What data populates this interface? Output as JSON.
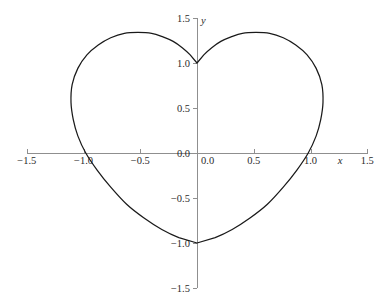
{
  "chart_data": {
    "type": "line",
    "title": "",
    "subtitle": "",
    "xlabel": "x",
    "ylabel": "y",
    "xlim": [
      -1.5,
      1.5
    ],
    "ylim": [
      -1.5,
      1.5
    ],
    "grid": false,
    "legend": null,
    "curve_name": "heart-curve",
    "curve_color": "#1a1a1a",
    "axis_color": "#8f8f8f",
    "label_color": "#2b2b2b",
    "x_ticks": [
      {
        "value": -1.5,
        "label": "−1.5"
      },
      {
        "value": -1.0,
        "label": "−1.0"
      },
      {
        "value": -0.5,
        "label": "−0.5"
      },
      {
        "value": 0.0,
        "label": "0.0"
      },
      {
        "value": 0.5,
        "label": "0.5"
      },
      {
        "value": 1.0,
        "label": "1.0"
      },
      {
        "value": 1.5,
        "label": "1.5"
      }
    ],
    "y_ticks": [
      {
        "value": 1.5,
        "label": "1.5"
      },
      {
        "value": 1.0,
        "label": "1.0"
      },
      {
        "value": 0.5,
        "label": "0.5"
      },
      {
        "value": 0.0,
        "label": "0.0"
      },
      {
        "value": -0.5,
        "label": "−0.5"
      },
      {
        "value": -1.0,
        "label": "−1.0"
      },
      {
        "value": -1.5,
        "label": "−1.5"
      }
    ],
    "annotations": [
      {
        "name": "top-cusp",
        "x": 0.0,
        "y": 1.0
      },
      {
        "name": "bottom-point",
        "x": 0.0,
        "y": -1.0
      },
      {
        "name": "left-extreme",
        "x": -1.1,
        "y": 0.55
      },
      {
        "name": "right-extreme",
        "x": 1.1,
        "y": 0.55
      },
      {
        "name": "left-lobe-top",
        "x": -0.52,
        "y": 1.34
      },
      {
        "name": "right-lobe-top",
        "x": 0.52,
        "y": 1.34
      },
      {
        "name": "left-x-crossing",
        "x": -0.98,
        "y": 0.0
      },
      {
        "name": "right-x-crossing",
        "x": 0.98,
        "y": 0.0
      }
    ],
    "points": [
      {
        "x": 0.0,
        "y": 1.0
      },
      {
        "x": 0.06,
        "y": 1.09
      },
      {
        "x": 0.13,
        "y": 1.17
      },
      {
        "x": 0.21,
        "y": 1.24
      },
      {
        "x": 0.3,
        "y": 1.29
      },
      {
        "x": 0.4,
        "y": 1.33
      },
      {
        "x": 0.52,
        "y": 1.34
      },
      {
        "x": 0.64,
        "y": 1.33
      },
      {
        "x": 0.76,
        "y": 1.28
      },
      {
        "x": 0.87,
        "y": 1.2
      },
      {
        "x": 0.97,
        "y": 1.09
      },
      {
        "x": 1.05,
        "y": 0.94
      },
      {
        "x": 1.1,
        "y": 0.76
      },
      {
        "x": 1.11,
        "y": 0.56
      },
      {
        "x": 1.09,
        "y": 0.37
      },
      {
        "x": 1.05,
        "y": 0.19
      },
      {
        "x": 0.98,
        "y": 0.0
      },
      {
        "x": 0.88,
        "y": -0.19
      },
      {
        "x": 0.76,
        "y": -0.38
      },
      {
        "x": 0.62,
        "y": -0.57
      },
      {
        "x": 0.47,
        "y": -0.72
      },
      {
        "x": 0.31,
        "y": -0.85
      },
      {
        "x": 0.16,
        "y": -0.94
      },
      {
        "x": 0.0,
        "y": -1.0
      },
      {
        "x": -0.16,
        "y": -0.94
      },
      {
        "x": -0.31,
        "y": -0.85
      },
      {
        "x": -0.47,
        "y": -0.72
      },
      {
        "x": -0.62,
        "y": -0.57
      },
      {
        "x": -0.76,
        "y": -0.38
      },
      {
        "x": -0.88,
        "y": -0.19
      },
      {
        "x": -0.98,
        "y": 0.0
      },
      {
        "x": -1.05,
        "y": 0.19
      },
      {
        "x": -1.09,
        "y": 0.37
      },
      {
        "x": -1.11,
        "y": 0.56
      },
      {
        "x": -1.1,
        "y": 0.76
      },
      {
        "x": -1.05,
        "y": 0.94
      },
      {
        "x": -0.97,
        "y": 1.09
      },
      {
        "x": -0.87,
        "y": 1.2
      },
      {
        "x": -0.76,
        "y": 1.28
      },
      {
        "x": -0.64,
        "y": 1.33
      },
      {
        "x": -0.52,
        "y": 1.34
      },
      {
        "x": -0.4,
        "y": 1.33
      },
      {
        "x": -0.3,
        "y": 1.29
      },
      {
        "x": -0.21,
        "y": 1.24
      },
      {
        "x": -0.13,
        "y": 1.17
      },
      {
        "x": -0.06,
        "y": 1.09
      },
      {
        "x": 0.0,
        "y": 1.0
      }
    ]
  },
  "geometry": {
    "origin_px": {
      "x": 197,
      "y": 153
    },
    "px_per_unit_x": 113.5,
    "px_per_unit_y": 90.0,
    "x_axis_extent_px": {
      "left": 27,
      "right": 368
    },
    "y_axis_extent_px": {
      "top": 18,
      "bottom": 288
    }
  },
  "artifacts": {
    "header_text": "",
    "footer_text": ""
  }
}
